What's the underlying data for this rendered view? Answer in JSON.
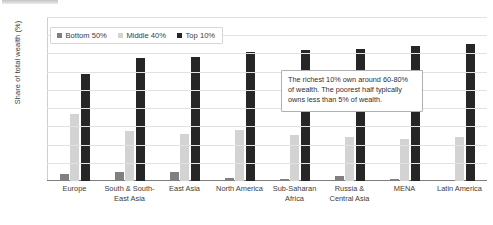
{
  "chart_data": {
    "type": "bar",
    "title": "",
    "xlabel": "",
    "ylabel": "Share of total wealth (%)",
    "ylim": [
      0,
      90
    ],
    "ytick_labels": [
      "90%",
      "80%",
      "70%",
      "60%",
      "50%",
      "40%",
      "30%",
      "20%",
      "10%",
      "0%"
    ],
    "ytick_values": [
      90,
      80,
      70,
      60,
      50,
      40,
      30,
      20,
      10,
      0
    ],
    "grid": true,
    "legend_position": "top-left",
    "categories": [
      "Europe",
      "South & South-East Asia",
      "East Asia",
      "North America",
      "Sub-Saharan Africa",
      "Russia & Central Asia",
      "MENA",
      "Latin America"
    ],
    "series": [
      {
        "name": "Bottom 50%",
        "color": "#808080",
        "values": [
          4.0,
          4.7,
          4.8,
          1.5,
          1.0,
          3.0,
          1.2,
          0.8
        ]
      },
      {
        "name": "Middle 40%",
        "color": "#d3d3d3",
        "values": [
          37.0,
          27.5,
          26.0,
          27.8,
          25.5,
          24.0,
          23.0,
          24.0
        ]
      },
      {
        "name": "Top 10%",
        "color": "#262626",
        "values": [
          58.5,
          67.5,
          68.0,
          71.0,
          72.0,
          72.5,
          74.0,
          75.0
        ]
      }
    ],
    "annotations": [
      {
        "text": "The richest 10% own around 60-80% of wealth. The poorest half typically owns less than 5% of wealth."
      }
    ]
  }
}
